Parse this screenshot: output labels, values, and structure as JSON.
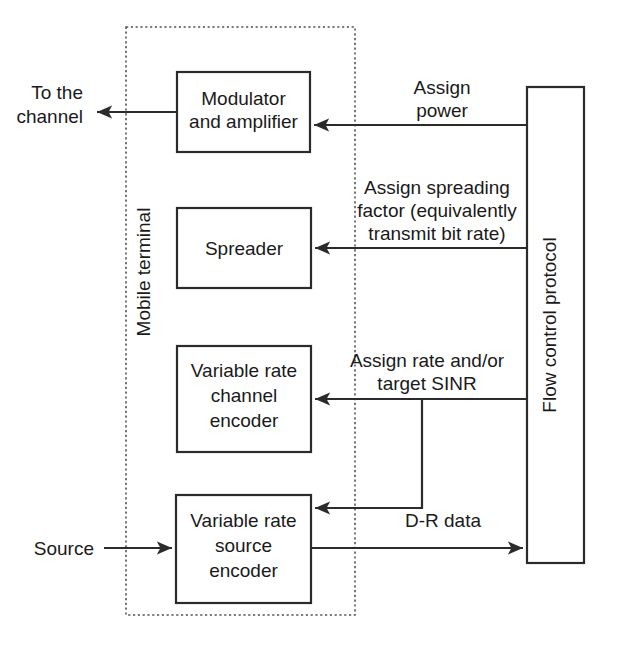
{
  "diagram": {
    "enclosure_label": "Mobile terminal",
    "blocks": [
      {
        "id": "modulator",
        "lines": [
          "Modulator",
          "and amplifier"
        ]
      },
      {
        "id": "spreader",
        "lines": [
          "Spreader"
        ]
      },
      {
        "id": "channel_encoder",
        "lines": [
          "Variable rate",
          "channel",
          "encoder"
        ]
      },
      {
        "id": "source_encoder",
        "lines": [
          "Variable rate",
          "source",
          "encoder"
        ]
      },
      {
        "id": "flow_control",
        "lines": [
          "Flow control protocol"
        ]
      }
    ],
    "edge_labels": {
      "to_channel": [
        "To the",
        "channel"
      ],
      "source": "Source",
      "assign_power": [
        "Assign",
        "power"
      ],
      "assign_spreading": [
        "Assign spreading",
        "factor (equivalently",
        "transmit bit rate)"
      ],
      "assign_rate": [
        "Assign rate and/or",
        "target SINR"
      ],
      "dr_data": "D-R data"
    },
    "colors": {
      "line": "#2b2b2b",
      "dashed": "#555555",
      "text": "#1a1a1a",
      "background": "#ffffff"
    }
  }
}
